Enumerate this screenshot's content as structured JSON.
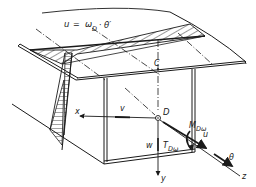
{
  "diagram": {
    "type": "thin-walled beam section warping diagram",
    "formula": {
      "lhs": "u",
      "eq": "=",
      "omega": "ω",
      "omega_sub": "D",
      "dot": "·",
      "theta": "θ′"
    },
    "labels": {
      "C": "C",
      "D": "D",
      "x": "x",
      "v": "v",
      "w": "w",
      "y": "y",
      "z": "z",
      "u": "u",
      "theta": "θ",
      "M": "M",
      "M_sub": "Dω",
      "T": "T",
      "T_sub": "Dω"
    },
    "colors": {
      "ink": "#1a1a1a",
      "background": "#ffffff"
    }
  }
}
